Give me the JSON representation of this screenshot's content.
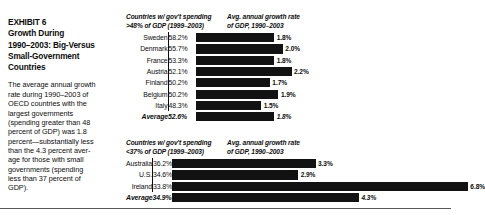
{
  "exhibit": {
    "title_lines": [
      "EXHIBIT 6",
      "Growth During",
      "1990–2003: Big-Versus",
      "Small-Government",
      "Countries"
    ],
    "body_lines": [
      "The average annual growth",
      "rate during 1990–2003 of",
      "OECD countries with the",
      "largest governments",
      "(spending greater than 48",
      "percent of GDP) was 1.8",
      "percent—substantially less",
      "than the 4.3 percent aver-",
      "age for those with small",
      "governments (spending",
      "less than 37 percent of",
      "GDP)."
    ]
  },
  "panels": [
    {
      "id": "big-government",
      "header_left_lines": [
        "Countries w/ gov't spending",
        ">48% of GDP (1999–2003)"
      ],
      "header_right_lines": [
        "Avg. annual growth rate",
        "of GDP, 1990–2003"
      ],
      "rows": [
        {
          "name": "Sweden",
          "spending": "58.2%",
          "growth": "1.8%",
          "growth_value": 1.8,
          "average": false
        },
        {
          "name": "Denmark",
          "spending": "55.7%",
          "growth": "2.0%",
          "growth_value": 2.0,
          "average": false
        },
        {
          "name": "France",
          "spending": "53.3%",
          "growth": "1.8%",
          "growth_value": 1.8,
          "average": false
        },
        {
          "name": "Austria",
          "spending": "52.1%",
          "growth": "2.2%",
          "growth_value": 2.2,
          "average": false
        },
        {
          "name": "Finland",
          "spending": "50.2%",
          "growth": "1.7%",
          "growth_value": 1.7,
          "average": false
        },
        {
          "name": "Belgium",
          "spending": "50.2%",
          "growth": "1.9%",
          "growth_value": 1.9,
          "average": false
        },
        {
          "name": "Italy",
          "spending": "48.3%",
          "growth": "1.5%",
          "growth_value": 1.5,
          "average": false
        },
        {
          "name": "Average",
          "spending": "52.6%",
          "growth": "1.8%",
          "growth_value": 1.8,
          "average": true
        }
      ]
    },
    {
      "id": "small-government",
      "header_left_lines": [
        "Countries w/ gov't spending",
        "<37% of GDP (1999–2003)"
      ],
      "header_right_lines": [
        "Avg. annual growth rate",
        "of GDP, 1990–2003"
      ],
      "rows": [
        {
          "name": "Australia",
          "spending": "36.2%",
          "growth": "3.3%",
          "growth_value": 3.3,
          "average": false
        },
        {
          "name": "U.S.",
          "spending": "34.6%",
          "growth": "2.9%",
          "growth_value": 2.9,
          "average": false
        },
        {
          "name": "Ireland",
          "spending": "33.8%",
          "growth": "6.8%",
          "growth_value": 6.8,
          "average": false
        },
        {
          "name": "Average",
          "spending": "34.9%",
          "growth": "4.3%",
          "growth_value": 4.3,
          "average": true
        }
      ]
    }
  ],
  "chart_data": {
    "type": "bar",
    "xlabel": "Avg. annual growth rate of GDP, 1990–2003",
    "ylabel": "",
    "xlim": [
      0,
      7
    ],
    "grid": false,
    "legend": "none",
    "orientation": "horizontal",
    "groups": [
      {
        "name": "Countries w/ gov't spending >48% of GDP (1999–2003)",
        "categories": [
          "Sweden",
          "Denmark",
          "France",
          "Austria",
          "Finland",
          "Belgium",
          "Italy",
          "Average"
        ],
        "spending_pct": [
          58.2,
          55.7,
          53.3,
          52.1,
          50.2,
          50.2,
          48.3,
          52.6
        ],
        "values": [
          1.8,
          2.0,
          1.8,
          2.2,
          1.7,
          1.9,
          1.5,
          1.8
        ]
      },
      {
        "name": "Countries w/ gov't spending <37% of GDP (1999–2003)",
        "categories": [
          "Australia",
          "U.S.",
          "Ireland",
          "Average"
        ],
        "spending_pct": [
          36.2,
          34.6,
          33.8,
          34.9
        ],
        "values": [
          3.3,
          2.9,
          6.8,
          4.3
        ]
      }
    ]
  },
  "style": {
    "bar_color": "#121212",
    "rule_color": "#55595c",
    "px_per_percent": 43.5
  }
}
